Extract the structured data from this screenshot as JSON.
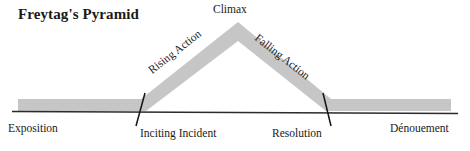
{
  "diagram": {
    "title": "Freytag's Pyramid",
    "type": "narrative-structure-diagram",
    "colors": {
      "band": "#c6c6c6",
      "baseline": "#2b2b2b",
      "tick": "#1a1a1a",
      "text": "#1a1a1a",
      "background": "#ffffff"
    },
    "stages": {
      "exposition": "Exposition",
      "inciting_incident": "Inciting Incident",
      "rising_action": "Rising Action",
      "climax": "Climax",
      "falling_action": "Falling Action",
      "resolution": "Resolution",
      "denouement": "Dénouement"
    }
  }
}
